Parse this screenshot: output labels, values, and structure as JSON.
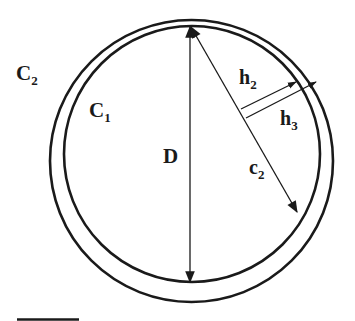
{
  "figure": {
    "colors": {
      "stroke": "#1a1a1a",
      "background": "#ffffff"
    },
    "circles": [
      {
        "name": "C1",
        "cx": 192,
        "cy": 154,
        "r": 128
      },
      {
        "name": "C2",
        "cx": 191.5,
        "cy": 161,
        "rx": 141.5,
        "ry": 141
      }
    ],
    "arrows": {
      "D": {
        "x1": 190,
        "y1": 25,
        "x2": 190,
        "y2": 283
      },
      "c2": {
        "x1": 190,
        "y1": 25,
        "x2": 298,
        "y2": 213
      },
      "h2": {
        "x1": 240,
        "y1": 108,
        "x2": 296,
        "y2": 81
      },
      "h3": {
        "x1": 245,
        "y1": 117,
        "x2": 317,
        "y2": 81
      }
    },
    "labels": {
      "C2": {
        "main": "C",
        "sub": "2"
      },
      "C1": {
        "main": "C",
        "sub": "1"
      },
      "D": {
        "main": "D"
      },
      "h2": {
        "main": "h",
        "sub": "2"
      },
      "h3": {
        "main": "h",
        "sub": "3"
      },
      "c2": {
        "main": "c",
        "sub": "2"
      }
    },
    "scale_bar": {
      "x1": 17,
      "x2": 79,
      "y": 320
    }
  }
}
